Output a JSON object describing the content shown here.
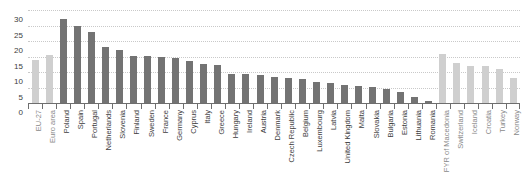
{
  "chart_data": {
    "type": "bar",
    "title": "",
    "xlabel": "",
    "ylabel": "",
    "ylim": [
      0,
      30
    ],
    "grid": true,
    "legend": "none",
    "y_ticks": [
      0,
      5,
      10,
      15,
      20,
      25,
      30
    ],
    "y_tick_labels": [
      "0",
      "5",
      "10",
      "15",
      "20",
      "25",
      "30"
    ],
    "categories": [
      "EU-27",
      "Euro area",
      "Poland",
      "Spain",
      "Portugal",
      "Netherlands",
      "Slovenia",
      "Finland",
      "Sweden",
      "France",
      "Germany",
      "Cyprus",
      "Italy",
      "Greece",
      "Hungary",
      "Ireland",
      "Austria",
      "Denmark",
      "Czech Republic",
      "Belgium",
      "Luxembourg",
      "Latvia",
      "United Kingdom",
      "Malta",
      "Slovakia",
      "Bulgaria",
      "Estonia",
      "Lithuania",
      "Romania",
      "FYR of Macedonia",
      "Switzerland",
      "Iceland",
      "Croatia",
      "Turkey",
      "Norway"
    ],
    "values": [
      13.9,
      15.4,
      27.1,
      25.0,
      23.0,
      18.2,
      17.0,
      15.3,
      15.2,
      15.0,
      14.6,
      13.5,
      12.7,
      12.3,
      9.5,
      9.2,
      9.1,
      8.5,
      8.1,
      7.9,
      6.9,
      6.5,
      5.9,
      5.4,
      5.3,
      4.4,
      3.6,
      2.1,
      0.7,
      15.9,
      12.8,
      12.1,
      11.9,
      11.0,
      8.1
    ],
    "bar_styles": [
      "light",
      "light",
      "dark",
      "dark",
      "dark",
      "dark",
      "dark",
      "dark",
      "dark",
      "dark",
      "dark",
      "dark",
      "dark",
      "dark",
      "dark",
      "dark",
      "dark",
      "dark",
      "dark",
      "dark",
      "dark",
      "dark",
      "dark",
      "dark",
      "dark",
      "dark",
      "dark",
      "dark",
      "dark",
      "light",
      "light",
      "light",
      "light",
      "light",
      "light"
    ],
    "colors": {
      "bar_dark": "#737373",
      "bar_light": "#cfcfcf",
      "gridline": "#c9c9c9",
      "axis": "#6e6e6e",
      "text": "#3d3d3d",
      "background": "#ffffff"
    }
  }
}
